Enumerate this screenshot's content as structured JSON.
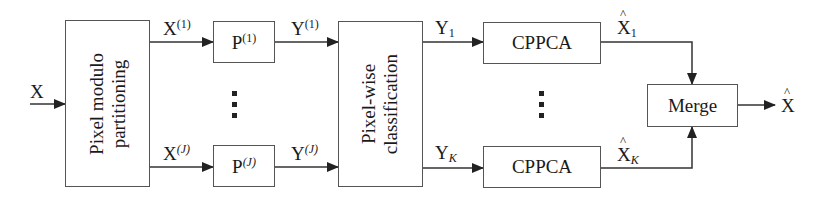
{
  "diagram": {
    "input_label": "X",
    "output_label": "X",
    "output_hat": true,
    "blocks": {
      "partition": {
        "label_line1": "Pixel modulo",
        "label_line2": "partitioning"
      },
      "p_top": {
        "base": "P",
        "sup": "(1)"
      },
      "p_bottom": {
        "base": "P",
        "sup": "(J)"
      },
      "classify": {
        "label_line1": "Pixel-wise",
        "label_line2": "classification"
      },
      "cppca_top": {
        "label": "CPPCA"
      },
      "cppca_bottom": {
        "label": "CPPCA"
      },
      "merge": {
        "label": "Merge"
      }
    },
    "edges": {
      "x1": {
        "base": "X",
        "sup": "(1)"
      },
      "xj": {
        "base": "X",
        "sup": "(J)"
      },
      "y1_sup": {
        "base": "Y",
        "sup": "(1)"
      },
      "yj_sup": {
        "base": "Y",
        "sup": "(J)"
      },
      "y_sub1": {
        "base": "Y",
        "sub": "1"
      },
      "y_subk": {
        "base": "Y",
        "sub": "K"
      },
      "xhat1": {
        "base": "X",
        "sub": "1"
      },
      "xhatk": {
        "base": "X",
        "sub": "K"
      }
    },
    "ellipsis": "⋮",
    "colors": {
      "line": "#333333",
      "box_border": "#555555",
      "background": "#ffffff"
    }
  }
}
